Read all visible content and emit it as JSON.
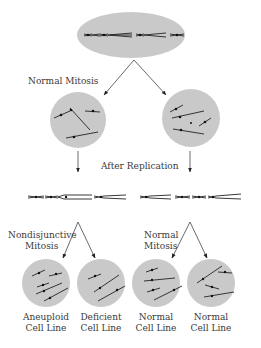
{
  "diagram": {
    "labels": {
      "normal_mitosis_top": "Normal Mitosis",
      "after_replication": "After Replication",
      "nondisjunctive_line1": "Nondisjunctive",
      "nondisjunctive_line2": "Mitosis",
      "normal_mitosis_line1": "Normal",
      "normal_mitosis_line2": "Mitosis"
    },
    "cell_lines": [
      {
        "line1": "Aneuploid",
        "line2": "Cell Line"
      },
      {
        "line1": "Deficient",
        "line2": "Cell Line"
      },
      {
        "line1": "Normal",
        "line2": "Cell Line"
      },
      {
        "line1": "Normal",
        "line2": "Cell Line"
      }
    ],
    "colors": {
      "cell_fill": "#c9c9c9",
      "chromosome": "#222222",
      "arrow": "#444444",
      "text": "#3a3a3a"
    }
  }
}
